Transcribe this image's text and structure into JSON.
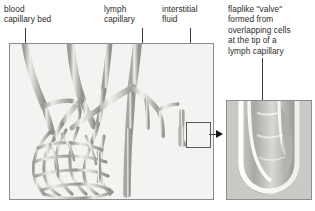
{
  "figure": {
    "background_color": "#ffffff",
    "panel_fill": "#f3f3f1",
    "panel_border": "#8d8d8d",
    "vessel_light": "#e4e4e2",
    "vessel_mid": "#b9b9b5",
    "vessel_dark": "#8f8f8b",
    "leader_color": "#3a3a3a",
    "arrow_color": "#111111"
  },
  "labels": {
    "blood_capillary_bed": "blood\ncapillary bed",
    "lymph_capillary": "lymph\ncapillary",
    "interstitial_fluid": "interstitial\nfluid",
    "valve_caption": "flaplike \"valve\"\nformed from\noverlapping cells\nat the tip of a\nlymph capillary"
  },
  "icons": {
    "callout_arrow": "arrow-right-icon",
    "callout_box": "magnify-region-icon"
  }
}
